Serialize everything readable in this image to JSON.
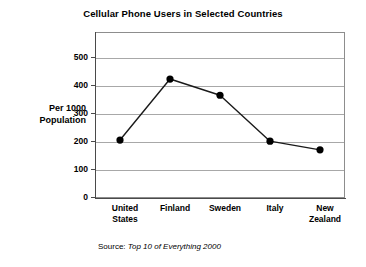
{
  "chart_data": {
    "type": "line",
    "title": "Cellular Phone Users in Selected Countries",
    "xlabel": "",
    "ylabel": "Per 1000 Population",
    "categories": [
      "United States",
      "Finland",
      "Sweden",
      "Italy",
      "New Zealand"
    ],
    "values": [
      207,
      425,
      367,
      203,
      172
    ],
    "series": [
      {
        "name": "Cellular phone users per 1000 population",
        "values": [
          207,
          425,
          367,
          203,
          172
        ]
      }
    ],
    "ylim": [
      0,
      593
    ],
    "yticks": [
      0,
      100,
      200,
      300,
      400,
      500
    ],
    "ytick_labels": [
      "0",
      "100",
      "200",
      "300",
      "400",
      "500"
    ],
    "grid": "horizontal",
    "legend": "none",
    "marker": "filled-circle",
    "line_color": "#1a1a1a",
    "marker_color": "#000000",
    "grid_color": "#a8a8a8",
    "plot_background": "#ffffff"
  },
  "title": {
    "text": "Cellular Phone Users in Selected Countries"
  },
  "axes": {
    "y_title_line1": "Per 1000",
    "y_title_line2": "Population",
    "y_ticks": [
      {
        "label": "500",
        "value": 500
      },
      {
        "label": "400",
        "value": 400
      },
      {
        "label": "300",
        "value": 300
      },
      {
        "label": "200",
        "value": 200
      },
      {
        "label": "100",
        "value": 100
      },
      {
        "label": "0",
        "value": 0
      }
    ],
    "x_categories": [
      {
        "line1": "United",
        "line2": "States"
      },
      {
        "line1": "Finland",
        "line2": ""
      },
      {
        "line1": "Sweden",
        "line2": ""
      },
      {
        "line1": "Italy",
        "line2": ""
      },
      {
        "line1": "New",
        "line2": "Zealand"
      }
    ]
  },
  "source": {
    "label": "Source:",
    "publication": "Top 10 of Everything 2000"
  }
}
